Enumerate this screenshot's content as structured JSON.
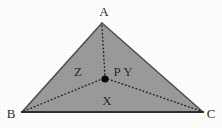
{
  "figure": {
    "type": "geometry-diagram",
    "width": 222,
    "height": 128,
    "background_color": "#fdfdfc",
    "fill_color": "#9a9a9a",
    "outline_color": "#4a4a4a",
    "dotted_color": "#2b2b2b",
    "point_color": "#000000"
  },
  "vertices": [
    {
      "name": "A",
      "label": "A",
      "x": 102,
      "y": 23,
      "label_x": 104,
      "label_y": 11
    },
    {
      "name": "B",
      "label": "B",
      "x": 22,
      "y": 112,
      "label_x": 11,
      "label_y": 113
    },
    {
      "name": "C",
      "label": "C",
      "x": 203,
      "y": 112,
      "label_x": 211,
      "label_y": 113
    }
  ],
  "interior_point": {
    "name": "P",
    "label": "P",
    "x": 105,
    "y": 79,
    "label_x": 117,
    "label_y": 71,
    "radius": 3.6
  },
  "regions": [
    {
      "name": "Z",
      "label": "Z",
      "label_x": 78,
      "label_y": 71,
      "between": "A-B-P"
    },
    {
      "name": "Y",
      "label": "Y",
      "label_x": 128,
      "label_y": 71,
      "between": "A-P-C"
    },
    {
      "name": "X",
      "label": "X",
      "label_x": 107,
      "label_y": 100,
      "between": "B-P-C"
    }
  ],
  "edges": [
    {
      "name": "AB",
      "from": "A",
      "to": "B",
      "style": "solid"
    },
    {
      "name": "AC",
      "from": "A",
      "to": "C",
      "style": "solid"
    },
    {
      "name": "BC",
      "from": "B",
      "to": "C",
      "style": "solid"
    }
  ],
  "cevians": [
    {
      "name": "AP",
      "from": "A",
      "to": "P",
      "style": "dotted"
    },
    {
      "name": "BP",
      "from": "B",
      "to": "P",
      "style": "dotted"
    },
    {
      "name": "PC",
      "from": "P",
      "to": "C",
      "style": "dotted"
    }
  ]
}
